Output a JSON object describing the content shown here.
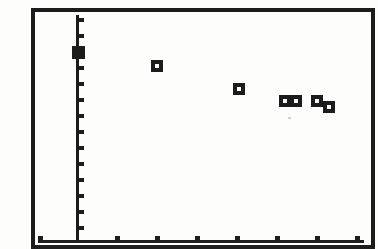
{
  "colors": {
    "ink": "#1c1c1c",
    "paper": "#fdfdfb",
    "speck": "#9a9a9a"
  },
  "chart_data": {
    "type": "scatter",
    "title": "",
    "xlabel": "",
    "ylabel": "",
    "axes_labeled": false,
    "grid": false,
    "legend": false,
    "marker": "open-square",
    "xlim": [
      -1,
      7.4
    ],
    "ylim": [
      0,
      14.2
    ],
    "x_tick_step_units": 1,
    "y_tick_step_units": 1,
    "points_units": [
      {
        "x": 0.0,
        "y": 11.8,
        "marker": "filled-square",
        "note": "sits on y-axis"
      },
      {
        "x": 2.0,
        "y": 11.0,
        "marker": "open-square"
      },
      {
        "x": 4.0,
        "y": 9.6,
        "marker": "open-square"
      },
      {
        "x": 5.2,
        "y": 8.8,
        "marker": "open-square"
      },
      {
        "x": 5.5,
        "y": 8.8,
        "marker": "open-square"
      },
      {
        "x": 6.0,
        "y": 8.8,
        "marker": "open-square"
      },
      {
        "x": 6.3,
        "y": 8.4,
        "marker": "open-square"
      }
    ],
    "layout_px": {
      "y_axis": {
        "x": 76,
        "top": 15,
        "bottom": 243,
        "thickness": 3
      },
      "x_axis": {
        "y": 240,
        "left": 38,
        "right": 364,
        "thickness": 3
      },
      "y_tick": {
        "width": 5,
        "height": 4,
        "side": "right",
        "tops": [
          18,
          34,
          50,
          66,
          82,
          98,
          114,
          130,
          146,
          162,
          178,
          194,
          210,
          226
        ]
      },
      "x_tick": {
        "width": 5,
        "height": 4,
        "side": "above",
        "lefts": [
          38,
          115,
          155,
          195,
          235,
          275,
          315,
          355
        ]
      },
      "points": [
        {
          "cx": 78,
          "cy": 52,
          "filled": true
        },
        {
          "cx": 157,
          "cy": 66,
          "filled": false
        },
        {
          "cx": 239,
          "cy": 89,
          "filled": false
        },
        {
          "cx": 285,
          "cy": 101,
          "filled": false
        },
        {
          "cx": 296,
          "cy": 101,
          "filled": false
        },
        {
          "cx": 317,
          "cy": 101,
          "filled": false
        },
        {
          "cx": 329,
          "cy": 107,
          "filled": false
        }
      ],
      "specks": [
        {
          "x": 288,
          "y": 117
        }
      ]
    }
  }
}
